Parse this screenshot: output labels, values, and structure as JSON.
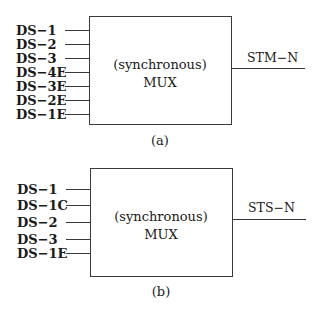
{
  "diagrams": [
    {
      "id": "a",
      "caption": "(a)",
      "box_line1": "(synchronous)",
      "box_line2": "MUX",
      "output": "STM−N",
      "inputs": [
        "DS−1",
        "DS−2",
        "DS−3",
        "DS−4E",
        "DS−3E",
        "DS−2E",
        "DS−1E"
      ]
    },
    {
      "id": "b",
      "caption": "(b)",
      "box_line1": "(synchronous)",
      "box_line2": "MUX",
      "output": "STS−N",
      "inputs": [
        "DS−1",
        "DS−1C",
        "DS−2",
        "DS−3",
        "DS−1E"
      ]
    }
  ]
}
